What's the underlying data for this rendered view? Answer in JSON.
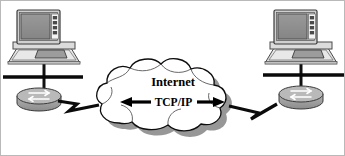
{
  "diagram": {
    "cloud": {
      "primary_label": "Internet",
      "protocol_label": "TCP/IP",
      "fill_color": "#ffffff",
      "outline_color": "#000000",
      "shadow_color": "#8a8a8a"
    },
    "arrows": {
      "left_arrow": "◀",
      "right_arrow": "▶",
      "direction": "bidirectional"
    },
    "nodes": [
      {
        "id": "left-site",
        "position": "left",
        "workstation": {
          "name": "workstation",
          "screen_color": "#8f8f8f",
          "case_color": "#d6d6d6",
          "bezel_color": "#b5b5b5",
          "button_count": 4
        },
        "router": {
          "name": "router",
          "body_color": "#9a9a9a",
          "top_color": "#bdbdbd",
          "symbol": "double-arrow"
        },
        "lan_segment": {
          "name": "lan-bus",
          "color": "#000000"
        }
      },
      {
        "id": "right-site",
        "position": "right",
        "workstation": {
          "name": "workstation",
          "screen_color": "#8f8f8f",
          "case_color": "#d6d6d6",
          "bezel_color": "#b5b5b5",
          "button_count": 4
        },
        "router": {
          "name": "router",
          "body_color": "#9a9a9a",
          "top_color": "#bdbdbd",
          "symbol": "double-arrow"
        },
        "lan_segment": {
          "name": "lan-bus",
          "color": "#000000"
        }
      }
    ],
    "links": [
      {
        "id": "left-wan-link",
        "from": "left-site-router",
        "to": "internet-cloud",
        "style": "lightning-zigzag",
        "color": "#000000"
      },
      {
        "id": "right-wan-link",
        "from": "internet-cloud",
        "to": "right-site-router",
        "style": "lightning-zigzag",
        "color": "#000000"
      }
    ]
  }
}
